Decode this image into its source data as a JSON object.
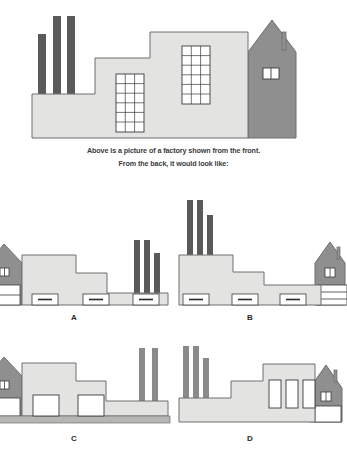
{
  "page": {
    "type": "visual-reasoning-question",
    "background_color": "#ffffff",
    "width": 347,
    "height": 454
  },
  "colors": {
    "building_light": "#e3e3e1",
    "building_dark": "#8f8f8f",
    "chimney_dark": "#5a5a5a",
    "outline": "#6e6e6e",
    "window_white": "#ffffff",
    "window_line": "#3a3a3a",
    "base_strip": "#b6b6b4",
    "text": "#3b3b3b"
  },
  "prompt": {
    "line1": "Above is a picture of a factory shown from the front.",
    "line2": "From the back, it would look like:"
  },
  "main_figure": {
    "name": "factory-front-view",
    "description": "Factory seen from the front: three chimneys at left, stepped light-grey factory block with two grid-paned windows, dark grey gabled house at right with small 2-pane window and thin roof chimney.",
    "chimney_count": 3,
    "grid_window_count": 2,
    "house_side": "right",
    "chimney_side": "left"
  },
  "options": [
    {
      "id": "A",
      "label": "A",
      "name": "option-a",
      "chimney_side": "right",
      "house_side": "left",
      "window_style": "small-dashed-rectangles",
      "window_count": 3,
      "mirrored": true
    },
    {
      "id": "B",
      "label": "B",
      "name": "option-b",
      "chimney_side": "left",
      "house_side": "right",
      "window_style": "small-dashed-rectangles",
      "window_count": 3,
      "mirrored": false
    },
    {
      "id": "C",
      "label": "C",
      "name": "option-c",
      "chimney_side": "right",
      "house_side": "left",
      "window_style": "large-square-outline",
      "window_count": 2,
      "mirrored": true
    },
    {
      "id": "D",
      "label": "D",
      "name": "option-d",
      "chimney_side": "left",
      "house_side": "right",
      "window_style": "tall-vertical-rectangles",
      "window_count": 3,
      "mirrored": false
    }
  ]
}
